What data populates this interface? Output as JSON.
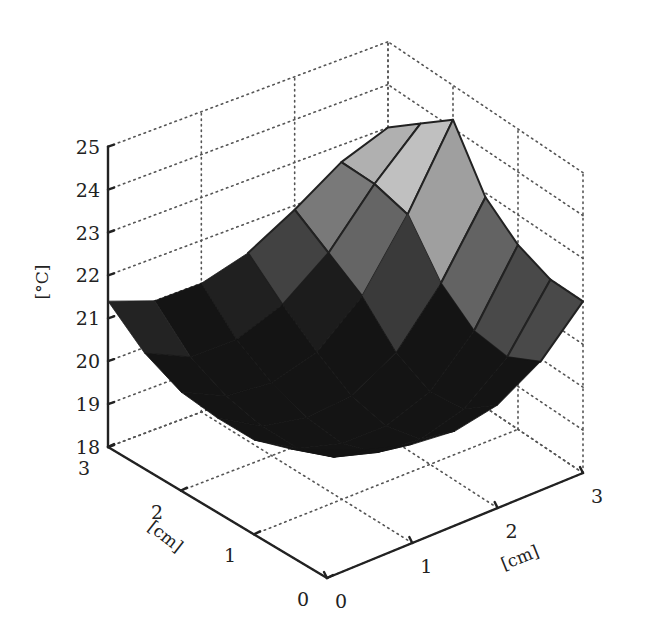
{
  "chart_data": {
    "type": "surface3d",
    "title": "",
    "xlabel": "[cm]",
    "ylabel": "[cm]",
    "zlabel": "[°C]",
    "x_ticks": [
      "0",
      "1",
      "2",
      "3"
    ],
    "y_ticks": [
      "0",
      "1",
      "2",
      "3"
    ],
    "z_ticks": [
      "18",
      "19",
      "20",
      "21",
      "22",
      "23",
      "24",
      "25"
    ],
    "xlim": [
      0,
      3
    ],
    "ylim": [
      0,
      3
    ],
    "zlim": [
      18,
      25
    ],
    "grid": true,
    "colormap": "gray",
    "grid_x": [
      0,
      0.5,
      1,
      1.5,
      2,
      2.5,
      3
    ],
    "grid_y": [
      0,
      0.5,
      1,
      1.5,
      2,
      2.5,
      3
    ],
    "z": [
      [
        21.0,
        20.6,
        20.3,
        20.2,
        20.4,
        21.0,
        22.0
      ],
      [
        20.5,
        19.9,
        19.6,
        19.5,
        19.8,
        20.6,
        22.0
      ],
      [
        20.2,
        19.6,
        19.3,
        19.3,
        19.7,
        20.7,
        22.3
      ],
      [
        20.2,
        19.6,
        19.4,
        19.5,
        20.1,
        21.3,
        22.9
      ],
      [
        20.3,
        19.8,
        19.7,
        20.0,
        20.9,
        22.4,
        24.2
      ],
      [
        20.7,
        20.2,
        20.2,
        20.6,
        21.4,
        22.6,
        23.6
      ],
      [
        21.4,
        21.0,
        21.0,
        21.3,
        21.9,
        22.6,
        23.0
      ]
    ]
  },
  "projection": {
    "p00": [
      327,
      578
    ],
    "p30": [
      583,
      473
    ],
    "p03": [
      108,
      447
    ],
    "p33": [
      388,
      342
    ],
    "z_px_per_unit": 42.9
  },
  "labels": {
    "z_axis": "[°C]",
    "x_axis": "[cm]",
    "y_axis": "[cm]"
  }
}
